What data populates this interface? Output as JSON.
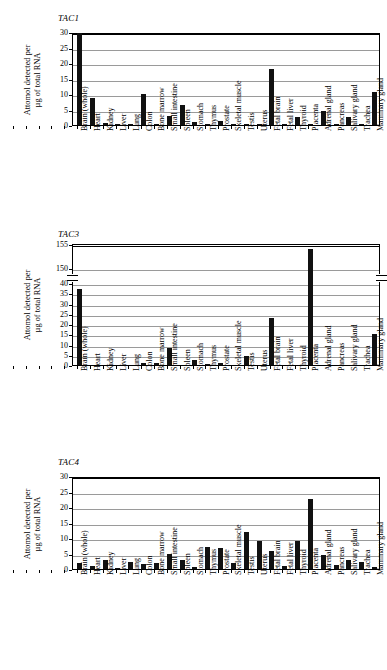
{
  "figure": {
    "panel_count": 3,
    "shared_ylabel_line1": "Attomol detected per",
    "shared_ylabel_line2": "µg of total RNA",
    "tissues": [
      "Brain (whole)",
      "Heart",
      "Kidney",
      "Liver",
      "Lung",
      "Colon",
      "Bone marrow",
      "Small intestine",
      "Spleen",
      "Stomach",
      "Thymus",
      "Prostate",
      "Skeletal muscle",
      "Testis",
      "Uterus",
      "Fetal brain",
      "Fetal liver",
      "Thyroid",
      "Placenta",
      "Adrenal gland",
      "Pancreas",
      "Salivary gland",
      "Trachea",
      "Mammary gland"
    ]
  },
  "panels": [
    {
      "title": "TAC1"
    },
    {
      "title": "TAC3"
    },
    {
      "title": "TAC4"
    }
  ],
  "chart_data": [
    {
      "type": "bar",
      "title": "TAC1",
      "xlabel": "",
      "ylabel": "Attomol detected per µg of total RNA",
      "ylim": [
        0,
        30
      ],
      "yticks": [
        0,
        5,
        10,
        15,
        20,
        25,
        30
      ],
      "grid": true,
      "legend": "none",
      "categories": [
        "Brain (whole)",
        "Heart",
        "Kidney",
        "Liver",
        "Lung",
        "Colon",
        "Bone marrow",
        "Small intestine",
        "Spleen",
        "Stomach",
        "Thymus",
        "Prostate",
        "Skeletal muscle",
        "Testis",
        "Uterus",
        "Fetal brain",
        "Fetal liver",
        "Thyroid",
        "Placenta",
        "Adrenal gland",
        "Pancreas",
        "Salivary gland",
        "Trachea",
        "Mammary gland"
      ],
      "values": [
        29.6,
        8.8,
        0.8,
        0.05,
        0.05,
        10.0,
        0.2,
        2.8,
        6.6,
        1.0,
        0.15,
        1.2,
        0.1,
        0.35,
        0.25,
        18.1,
        0.05,
        2.7,
        0.05,
        4.5,
        0.05,
        2.7,
        0.25,
        10.7
      ]
    },
    {
      "type": "bar",
      "title": "TAC3",
      "xlabel": "",
      "ylabel": "Attomol detected per µg of total RNA",
      "ylim": [
        0,
        155
      ],
      "axis_break": {
        "lower_max": 40,
        "upper_min": 150,
        "upper_max": 155
      },
      "yticks_lower": [
        0,
        5,
        10,
        15,
        20,
        25,
        30,
        35,
        40
      ],
      "yticks_upper": [
        150,
        155
      ],
      "grid": true,
      "legend": "none",
      "categories": [
        "Brain (whole)",
        "Heart",
        "Kidney",
        "Liver",
        "Lung",
        "Colon",
        "Bone marrow",
        "Small intestine",
        "Spleen",
        "Stomach",
        "Thymus",
        "Prostate",
        "Skeletal muscle",
        "Testis",
        "Uterus",
        "Fetal brain",
        "Fetal liver",
        "Thyroid",
        "Placenta",
        "Adrenal gland",
        "Pancreas",
        "Salivary gland",
        "Trachea",
        "Mammary gland"
      ],
      "values": [
        37.0,
        0.0,
        0.0,
        0.0,
        0.0,
        0.9,
        0.9,
        8.2,
        0.0,
        2.4,
        0.35,
        1.0,
        0.0,
        4.4,
        0.0,
        23.0,
        0.0,
        0.0,
        154.0,
        0.0,
        0.0,
        0.0,
        0.0,
        15.1
      ]
    },
    {
      "type": "bar",
      "title": "TAC4",
      "xlabel": "",
      "ylabel": "Attomol detected per µg of total RNA",
      "ylim": [
        0,
        30
      ],
      "yticks": [
        0,
        5,
        10,
        15,
        20,
        25,
        30
      ],
      "grid": true,
      "legend": "none",
      "categories": [
        "Brain (whole)",
        "Heart",
        "Kidney",
        "Liver",
        "Lung",
        "Colon",
        "Bone marrow",
        "Small intestine",
        "Spleen",
        "Stomach",
        "Thymus",
        "Prostate",
        "Skeletal muscle",
        "Testis",
        "Uterus",
        "Fetal brain",
        "Fetal liver",
        "Thyroid",
        "Placenta",
        "Adrenal gland",
        "Pancreas",
        "Salivary gland",
        "Trachea",
        "Mammary gland"
      ],
      "values": [
        1.8,
        1.0,
        2.8,
        0.4,
        2.4,
        1.5,
        2.0,
        5.0,
        3.0,
        0.5,
        7.2,
        6.7,
        2.1,
        11.8,
        9.1,
        5.8,
        1.1,
        9.1,
        22.7,
        4.4,
        1.2,
        3.0,
        2.4,
        0.7
      ]
    }
  ]
}
